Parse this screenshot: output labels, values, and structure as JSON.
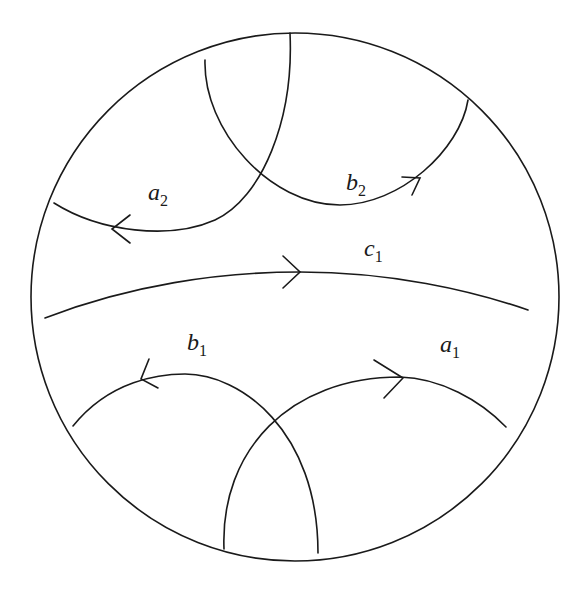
{
  "diagram": {
    "colors": {
      "stroke": "#1a1a1a",
      "background": "#ffffff"
    },
    "boundary": {
      "cx": 295,
      "cy": 297,
      "r": 264
    },
    "labels": {
      "a2": {
        "base": "a",
        "sub": "2"
      },
      "b2": {
        "base": "b",
        "sub": "2"
      },
      "c1": {
        "base": "c",
        "sub": "1"
      },
      "b1": {
        "base": "b",
        "sub": "1"
      },
      "a1": {
        "base": "a",
        "sub": "1"
      }
    },
    "curves": [
      {
        "id": "a2",
        "arrow_direction": "left"
      },
      {
        "id": "b2",
        "arrow_direction": "right"
      },
      {
        "id": "c1",
        "arrow_direction": "right"
      },
      {
        "id": "b1",
        "arrow_direction": "left"
      },
      {
        "id": "a1",
        "arrow_direction": "right"
      }
    ]
  }
}
